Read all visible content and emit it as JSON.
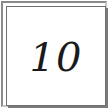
{
  "card": {
    "value": "10"
  }
}
